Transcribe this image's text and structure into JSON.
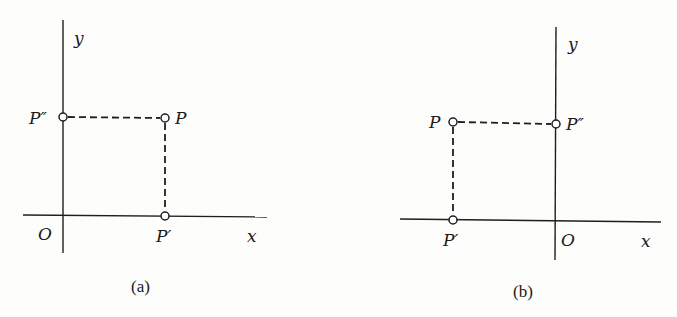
{
  "figures": [
    {
      "id": "a",
      "caption": "(a)",
      "axes": {
        "x_label": "x",
        "y_label": "y",
        "origin_label": "O"
      },
      "points": {
        "P": {
          "label": "P",
          "description": "point in first quadrant"
        },
        "P_prime": {
          "label": "P′",
          "description": "projection of P on x-axis"
        },
        "P_double_prime": {
          "label": "P″",
          "description": "projection of P on y-axis"
        }
      }
    },
    {
      "id": "b",
      "caption": "(b)",
      "axes": {
        "x_label": "x",
        "y_label": "y",
        "origin_label": "O"
      },
      "points": {
        "P": {
          "label": "P",
          "description": "point in second quadrant"
        },
        "P_prime": {
          "label": "P′",
          "description": "projection of P on x-axis"
        },
        "P_double_prime": {
          "label": "P″",
          "description": "projection of P on y-axis"
        }
      }
    }
  ]
}
